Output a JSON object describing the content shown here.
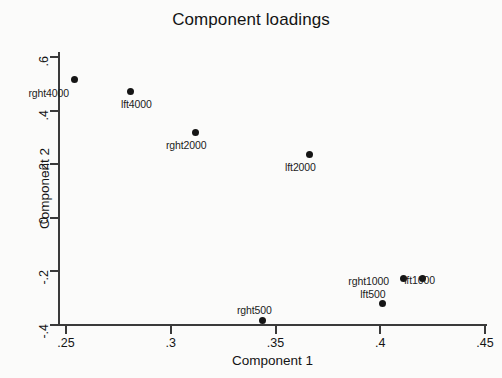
{
  "chart_data": {
    "type": "scatter",
    "title": "Component loadings",
    "xlabel": "Component 1",
    "ylabel": "Component 2",
    "xlim": [
      0.235,
      0.46
    ],
    "ylim": [
      -0.45,
      0.645
    ],
    "xticks": [
      ".25",
      ".3",
      ".35",
      ".4",
      ".45"
    ],
    "xtick_values": [
      0.25,
      0.3,
      0.35,
      0.4,
      0.45
    ],
    "yticks": [
      ".6",
      ".4",
      ".2",
      "0",
      "-.2",
      "-.4"
    ],
    "ytick_values": [
      0.6,
      0.4,
      0.2,
      0,
      -0.2,
      -0.4
    ],
    "grid": false,
    "legend": "none",
    "points": [
      {
        "label": "rght4000",
        "x": 0.254,
        "y": 0.515,
        "label_dx": -46,
        "label_dy": 7
      },
      {
        "label": "lft4000",
        "x": 0.281,
        "y": 0.473,
        "label_dx": -10,
        "label_dy": 7
      },
      {
        "label": "rght2000",
        "x": 0.312,
        "y": 0.32,
        "label_dx": -30,
        "label_dy": 7
      },
      {
        "label": "lft2000",
        "x": 0.366,
        "y": 0.237,
        "label_dx": -24,
        "label_dy": 7
      },
      {
        "label": "rght1000",
        "x": 0.411,
        "y": -0.228,
        "label_dx": -55,
        "label_dy": -4
      },
      {
        "label": "lft1000",
        "x": 0.42,
        "y": -0.225,
        "label_dx": -18,
        "label_dy": -4
      },
      {
        "label": "rght500",
        "x": 0.344,
        "y": -0.385,
        "label_dx": -26,
        "label_dy": -17
      },
      {
        "label": "lft500",
        "x": 0.401,
        "y": -0.318,
        "label_dx": -22,
        "label_dy": -15
      }
    ]
  }
}
